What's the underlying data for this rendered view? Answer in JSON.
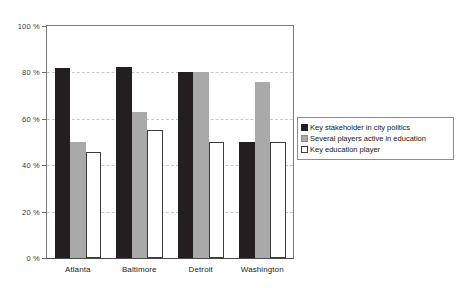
{
  "chart_data": {
    "type": "bar",
    "title": "",
    "subtitle": "",
    "xlabel": "",
    "ylabel": "",
    "grid": true,
    "legend_position": "right",
    "ylim": [
      0,
      100
    ],
    "ytick_labels": [
      "100 %",
      "80 %",
      "60 %",
      "40 %",
      "20 %",
      "0 %"
    ],
    "ytick_values": [
      100,
      80,
      60,
      40,
      20,
      0
    ],
    "categories": [
      "Atlanta",
      "Baltimore",
      "Detroit",
      "Washington"
    ],
    "series": [
      {
        "name": "Key stakeholder in city politics",
        "color": "#231f20",
        "values": [
          82,
          82.5,
          80,
          50
        ]
      },
      {
        "name": "Several players active in education",
        "color": "#a9a9a9",
        "values": [
          50,
          63,
          80,
          76
        ]
      },
      {
        "name": "Key education player",
        "color": "#ffffff",
        "values": [
          45.5,
          55,
          50,
          50
        ]
      }
    ]
  },
  "legend": {
    "items": [
      {
        "label": "Key stakeholder in city politics",
        "swatch": "legend-swatch-dark"
      },
      {
        "label": "Several players active in education",
        "swatch": "legend-swatch-gray"
      },
      {
        "label": "Key education player",
        "swatch": "legend-swatch-white"
      }
    ]
  }
}
